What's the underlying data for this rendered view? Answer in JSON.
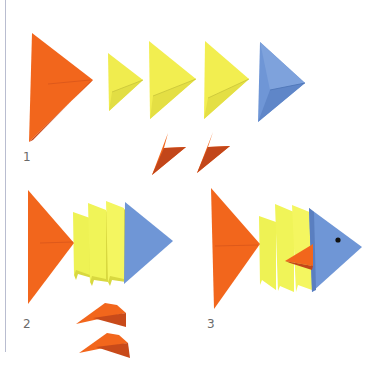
{
  "steps": [
    {
      "number": "1",
      "description": "Folded pieces: 1 large orange, 3 yellow, 1 blue triangle, 2 small orange fins"
    },
    {
      "number": "2",
      "description": "Stacked body pieces with 2 orange fins"
    },
    {
      "number": "3",
      "description": "Completed fish with eye and fin"
    }
  ],
  "colors": {
    "orange": "#f2661c",
    "orange_dark": "#c2461a",
    "yellow": "#f0ee52",
    "yellow_light": "#f6f46e",
    "yellow_shadow": "#c9c640",
    "blue": "#6f96d6",
    "blue_dark": "#5a7fc0",
    "eye": "#111111",
    "label": "#6a6a6a"
  }
}
